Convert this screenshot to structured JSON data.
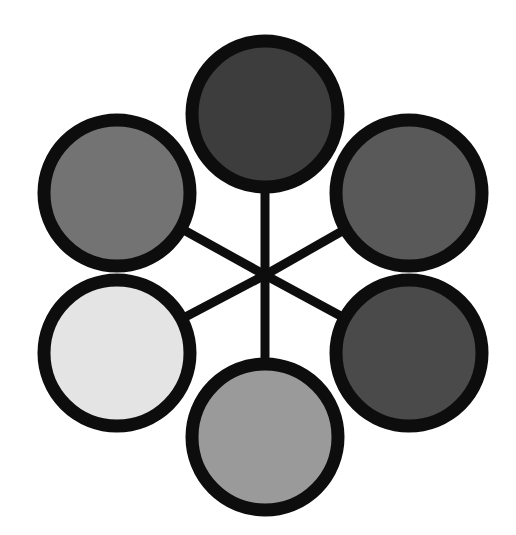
{
  "figure": {
    "background_color": "#ffffff",
    "stroke_color": "#0d0d0d",
    "node_stroke_width": 13,
    "spoke_stroke_width": 9,
    "hub": {
      "x": 265,
      "y": 275,
      "label": "center-hub"
    },
    "canvas": {
      "width": 516,
      "height": 535
    }
  },
  "chart_data": {
    "type": "scatter",
    "subtitle": "",
    "xlabel": "",
    "ylabel": "",
    "xlim": [
      0,
      516
    ],
    "ylim": [
      0,
      535
    ],
    "grid": false,
    "legend_position": "none",
    "layout": "radial-hub-and-spoke",
    "hub": {
      "x": 265,
      "y": 275
    },
    "node_count": 6,
    "categories": [
      "top",
      "upper-right",
      "lower-right",
      "bottom",
      "lower-left",
      "upper-left"
    ],
    "values": [
      24,
      35,
      29,
      60,
      89,
      45
    ],
    "series": [
      {
        "name": "grayscale_value_percent",
        "values": [
          24,
          35,
          29,
          60,
          89,
          45
        ]
      },
      {
        "name": "radius_px",
        "values": [
          80,
          80,
          80,
          80,
          80,
          80
        ]
      }
    ],
    "annotations": [
      "six circles connected to a single central hub by straight black spokes",
      "fills form a grayscale tonal scale from near-black to near-white"
    ]
  },
  "nodes": [
    {
      "id": "node-top",
      "name": "circle-top",
      "angle_deg": 90,
      "cx": 265,
      "cy": 114,
      "r": 73,
      "fill": "#3d3d3d",
      "tone_label": "very dark gray",
      "gray_percent": 24
    },
    {
      "id": "node-upper-right",
      "name": "circle-upper-right",
      "angle_deg": 30,
      "cx": 409,
      "cy": 193,
      "r": 73,
      "fill": "#595959",
      "tone_label": "dark gray",
      "gray_percent": 35
    },
    {
      "id": "node-lower-right",
      "name": "circle-lower-right",
      "angle_deg": -30,
      "cx": 409,
      "cy": 353,
      "r": 73,
      "fill": "#4a4a4a",
      "tone_label": "dark charcoal gray",
      "gray_percent": 29
    },
    {
      "id": "node-bottom",
      "name": "circle-bottom",
      "angle_deg": -90,
      "cx": 265,
      "cy": 437,
      "r": 73,
      "fill": "#9a9a9a",
      "tone_label": "medium light gray",
      "gray_percent": 60
    },
    {
      "id": "node-lower-left",
      "name": "circle-lower-left",
      "angle_deg": 210,
      "cx": 117,
      "cy": 353,
      "r": 73,
      "fill": "#e4e4e4",
      "tone_label": "very light gray",
      "gray_percent": 89
    },
    {
      "id": "node-upper-left",
      "name": "circle-upper-left",
      "angle_deg": 150,
      "cx": 117,
      "cy": 193,
      "r": 73,
      "fill": "#737373",
      "tone_label": "mid gray",
      "gray_percent": 45
    }
  ],
  "spokes": [
    {
      "id": "spoke-top",
      "name": "spoke-hub-to-top",
      "x1": 265,
      "y1": 275,
      "x2": 265,
      "y2": 114
    },
    {
      "id": "spoke-upper-right",
      "name": "spoke-hub-to-upper-right",
      "x1": 265,
      "y1": 275,
      "x2": 409,
      "y2": 193
    },
    {
      "id": "spoke-lower-right",
      "name": "spoke-hub-to-lower-right",
      "x1": 265,
      "y1": 275,
      "x2": 409,
      "y2": 353
    },
    {
      "id": "spoke-bottom",
      "name": "spoke-hub-to-bottom",
      "x1": 265,
      "y1": 275,
      "x2": 265,
      "y2": 437
    },
    {
      "id": "spoke-lower-left",
      "name": "spoke-hub-to-lower-left",
      "x1": 265,
      "y1": 275,
      "x2": 117,
      "y2": 353
    },
    {
      "id": "spoke-upper-left",
      "name": "spoke-hub-to-upper-left",
      "x1": 265,
      "y1": 275,
      "x2": 117,
      "y2": 193
    }
  ]
}
